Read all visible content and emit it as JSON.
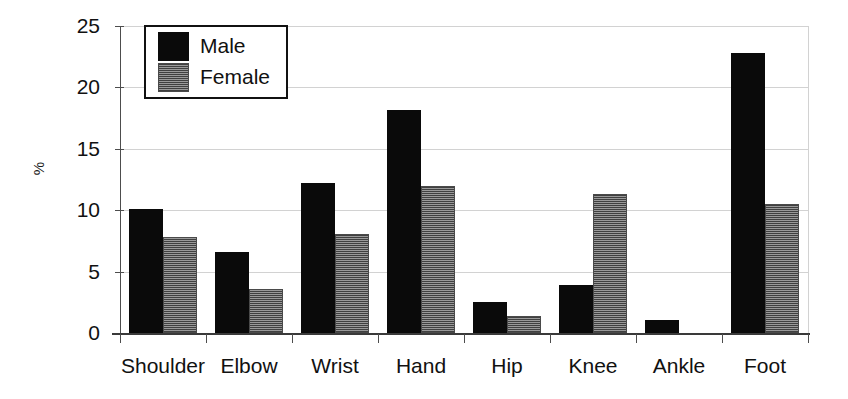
{
  "chart_data": {
    "type": "bar",
    "title": "",
    "subtitle": "",
    "xlabel": "",
    "ylabel": "%",
    "categories": [
      "Shoulder",
      "Elbow",
      "Wrist",
      "Hand",
      "Hip",
      "Knee",
      "Ankle",
      "Foot"
    ],
    "series": [
      {
        "name": "Male",
        "color": "#0a0a0a",
        "values": [
          10.1,
          6.6,
          12.2,
          18.2,
          2.5,
          3.9,
          1.1,
          22.8
        ]
      },
      {
        "name": "Female",
        "color": "#6e6e6e",
        "values": [
          7.8,
          3.6,
          8.1,
          12.0,
          1.4,
          11.3,
          0.0,
          10.5
        ]
      }
    ],
    "ylim": [
      0,
      25
    ],
    "yticks": [
      0,
      5,
      10,
      15,
      20,
      25
    ],
    "ytick_labels": [
      "0",
      "5",
      "10",
      "15",
      "20",
      "25"
    ],
    "grid": "horizontal",
    "legend_position": "top-left",
    "legend_entries": [
      "Male",
      "Female"
    ]
  },
  "axes": {
    "y_title": "%"
  },
  "legend": {
    "male_label": "Male",
    "female_label": "Female",
    "male_swatch": "black-square-icon",
    "female_swatch": "gray-hatched-square-icon"
  }
}
